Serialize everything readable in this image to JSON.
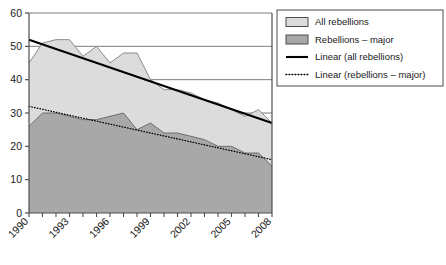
{
  "chart_data": {
    "type": "area",
    "title": "",
    "xlabel": "",
    "ylabel": "",
    "xlim": [
      1990,
      2008
    ],
    "ylim": [
      0,
      60
    ],
    "yticks": [
      0,
      10,
      20,
      30,
      40,
      50,
      60
    ],
    "ytick_labels": [
      "0",
      "10",
      "20",
      "30",
      "40",
      "50",
      "60"
    ],
    "grid": "horizontal",
    "legend_position": "right",
    "x": [
      1990,
      1991,
      1992,
      1993,
      1994,
      1995,
      1996,
      1997,
      1998,
      1999,
      2000,
      2001,
      2002,
      2003,
      2004,
      2005,
      2006,
      2007,
      2008
    ],
    "xtick_labels": [
      "1990",
      "",
      "",
      "1993",
      "",
      "",
      "1996",
      "",
      "",
      "1999",
      "",
      "",
      "2002",
      "",
      "",
      "2005",
      "",
      "",
      "2008"
    ],
    "xtick_labels_shown": [
      "1990",
      "1993",
      "1996",
      "1999",
      "2002",
      "2005",
      "2008"
    ],
    "series": [
      {
        "name": "All rebellions",
        "kind": "area",
        "fill": "#dcdcdc",
        "stroke": "#8a8a8a",
        "values": [
          45,
          51,
          52,
          52,
          47,
          50,
          45,
          48,
          48,
          40,
          37,
          37,
          36,
          34,
          33,
          31,
          29,
          31,
          27
        ]
      },
      {
        "name": "Rebellions – major",
        "kind": "area",
        "fill": "#a8a8a8",
        "stroke": "#6e6e6e",
        "values": [
          26,
          30,
          30,
          29,
          28,
          28,
          29,
          30,
          25,
          27,
          24,
          24,
          23,
          22,
          20,
          20,
          18,
          18,
          14
        ]
      },
      {
        "name": "Linear (all rebellions)",
        "kind": "trend-solid",
        "stroke": "#000000",
        "endpoints": [
          52,
          27
        ]
      },
      {
        "name": "Linear (rebellions – major)",
        "kind": "trend-dotted",
        "stroke": "#000000",
        "endpoints": [
          32,
          16
        ]
      }
    ],
    "legend": [
      {
        "label": "All rebellions",
        "marker": "swatch",
        "color": "#dcdcdc"
      },
      {
        "label": "Rebellions – major",
        "marker": "swatch",
        "color": "#a8a8a8"
      },
      {
        "label": "Linear (all rebellions)",
        "marker": "solid-line",
        "color": "#000000"
      },
      {
        "label": "Linear (rebellions – major)",
        "marker": "dotted-line",
        "color": "#000000"
      }
    ]
  },
  "colors": {
    "all_rebellions_fill": "#dcdcdc",
    "major_rebellions_fill": "#a8a8a8",
    "axis": "#4d4d4d",
    "gridline": "#6e6e6e",
    "trend": "#000000",
    "background": "#ffffff"
  }
}
